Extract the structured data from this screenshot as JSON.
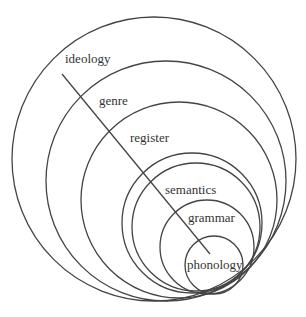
{
  "diagram": {
    "type": "nested-tangent-circles",
    "line_color": "#444444",
    "layers": [
      {
        "label": "ideology",
        "cx": 154,
        "cy": 159,
        "r": 142
      },
      {
        "label": "genre",
        "cx": 166,
        "cy": 181,
        "r": 120
      },
      {
        "label": "register",
        "cx": 179,
        "cy": 200,
        "r": 98
      },
      {
        "label": "semantics",
        "cx": 192,
        "cy": 223,
        "r": 70
      },
      {
        "label": "",
        "cx": 196,
        "cy": 227,
        "r": 64
      },
      {
        "label": "grammar",
        "cx": 207,
        "cy": 247,
        "r": 47
      },
      {
        "label": "phonology",
        "cx": 214,
        "cy": 265,
        "r": 29
      }
    ],
    "axis_line": {
      "x1": 62,
      "y1": 74,
      "x2": 210,
      "y2": 254
    },
    "labels": {
      "ideology": "ideology",
      "genre": "genre",
      "register": "register",
      "semantics": "semantics",
      "grammar": "grammar",
      "phonology": "phonology"
    }
  }
}
